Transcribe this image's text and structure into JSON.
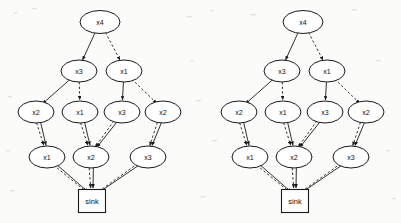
{
  "page": {
    "background_color": "#fbfbfa",
    "ink_color": "#1a1a1a",
    "width": 401,
    "height": 223
  },
  "diagrams": [
    {
      "id": "left-diagram",
      "name": "left-bdd",
      "origin_x": 0,
      "sink": {
        "label": "sink",
        "x": 92,
        "y": 201,
        "w": 27,
        "h": 23
      },
      "levels": [
        {
          "level": 1,
          "nodes": [
            {
              "id": "L1a",
              "label": "x4",
              "x": 100,
              "y": 22,
              "rx": 20,
              "ry": 11.5
            }
          ]
        },
        {
          "level": 2,
          "nodes": [
            {
              "id": "L2a",
              "label": "x3",
              "x": 79,
              "y": 71,
              "rx": 18,
              "ry": 11
            },
            {
              "id": "L2b",
              "label": "x1",
              "x": 124,
              "y": 71,
              "rx": 18,
              "ry": 11
            }
          ]
        },
        {
          "level": 3,
          "nodes": [
            {
              "id": "L3a",
              "label": "x2",
              "x": 36,
              "y": 112,
              "rx": 18,
              "ry": 11
            },
            {
              "id": "L3b",
              "label": "x1",
              "x": 80,
              "y": 112,
              "rx": 18,
              "ry": 11
            },
            {
              "id": "L3c",
              "label": "x3",
              "x": 122,
              "y": 112,
              "rx": 18,
              "ry": 11
            },
            {
              "id": "L3d",
              "label": "x2",
              "x": 163,
              "y": 112,
              "rx": 18,
              "ry": 11
            }
          ]
        },
        {
          "level": 4,
          "nodes": [
            {
              "id": "L4a",
              "label": "x1",
              "x": 47,
              "y": 157,
              "rx": 18,
              "ry": 11
            },
            {
              "id": "L4b",
              "label": "x2",
              "x": 91,
              "y": 157,
              "rx": 18,
              "ry": 11
            },
            {
              "id": "L4c",
              "label": "x3",
              "x": 148,
              "y": 157,
              "rx": 18,
              "ry": 11
            }
          ]
        }
      ],
      "edges": [
        {
          "from": "L1a",
          "to": "L2a",
          "style": "solid",
          "arrow": true
        },
        {
          "from": "L1a",
          "to": "L2b",
          "style": "dashed",
          "arrow": true
        },
        {
          "from": "L2a",
          "to": "L3a",
          "style": "solid",
          "arrow": true
        },
        {
          "from": "L2a",
          "to": "L3b",
          "style": "dashed",
          "arrow": true
        },
        {
          "from": "L2b",
          "to": "L3c",
          "style": "solid",
          "arrow": true
        },
        {
          "from": "L2b",
          "to": "L3d",
          "style": "dashed",
          "arrow": true
        },
        {
          "from": "L3a",
          "to": "L4a",
          "style": "solid",
          "arrow": true
        },
        {
          "from": "L3a",
          "to": "L4a",
          "style": "dashed",
          "arrow": true
        },
        {
          "from": "L3b",
          "to": "L4b",
          "style": "solid",
          "arrow": true
        },
        {
          "from": "L3b",
          "to": "L4b",
          "style": "dashed",
          "arrow": true
        },
        {
          "from": "L3c",
          "to": "L4b",
          "style": "solid",
          "arrow": true
        },
        {
          "from": "L3c",
          "to": "L4b",
          "style": "dashed",
          "arrow": true
        },
        {
          "from": "L3d",
          "to": "L4c",
          "style": "solid",
          "arrow": true
        },
        {
          "from": "L3d",
          "to": "L4c",
          "style": "dashed",
          "arrow": true
        },
        {
          "from": "L4a",
          "to": "sink",
          "style": "solid",
          "arrow": true
        },
        {
          "from": "L4a",
          "to": "sink",
          "style": "dashed",
          "arrow": true
        },
        {
          "from": "L4b",
          "to": "sink",
          "style": "solid",
          "arrow": true
        },
        {
          "from": "L4b",
          "to": "sink",
          "style": "dashed",
          "arrow": true
        },
        {
          "from": "L4c",
          "to": "sink",
          "style": "solid",
          "arrow": true
        },
        {
          "from": "L4c",
          "to": "sink",
          "style": "dashed",
          "arrow": true
        }
      ]
    },
    {
      "id": "right-diagram",
      "name": "right-bdd",
      "origin_x": 203,
      "sink": {
        "label": "sink",
        "x": 295,
        "y": 201,
        "w": 27,
        "h": 23
      },
      "levels": [
        {
          "level": 1,
          "nodes": [
            {
              "id": "R1a",
              "label": "x4",
              "x": 303,
              "y": 22,
              "rx": 20,
              "ry": 11.5
            }
          ]
        },
        {
          "level": 2,
          "nodes": [
            {
              "id": "R2a",
              "label": "x3",
              "x": 282,
              "y": 71,
              "rx": 18,
              "ry": 11
            },
            {
              "id": "R2b",
              "label": "x1",
              "x": 327,
              "y": 71,
              "rx": 18,
              "ry": 11
            }
          ]
        },
        {
          "level": 3,
          "nodes": [
            {
              "id": "R3a",
              "label": "x2",
              "x": 239,
              "y": 112,
              "rx": 18,
              "ry": 11
            },
            {
              "id": "R3b",
              "label": "x1",
              "x": 283,
              "y": 112,
              "rx": 18,
              "ry": 11
            },
            {
              "id": "R3c",
              "label": "x3",
              "x": 325,
              "y": 112,
              "rx": 18,
              "ry": 11
            },
            {
              "id": "R3d",
              "label": "x2",
              "x": 366,
              "y": 112,
              "rx": 18,
              "ry": 11
            }
          ]
        },
        {
          "level": 4,
          "nodes": [
            {
              "id": "R4a",
              "label": "x1",
              "x": 250,
              "y": 157,
              "rx": 18,
              "ry": 11
            },
            {
              "id": "R4b",
              "label": "x2",
              "x": 294,
              "y": 157,
              "rx": 18,
              "ry": 11
            },
            {
              "id": "R4c",
              "label": "x3",
              "x": 351,
              "y": 157,
              "rx": 18,
              "ry": 11
            }
          ]
        }
      ],
      "edges": [
        {
          "from": "R1a",
          "to": "R2a",
          "style": "solid",
          "arrow": true
        },
        {
          "from": "R1a",
          "to": "R2b",
          "style": "dashed",
          "arrow": true
        },
        {
          "from": "R2a",
          "to": "R3a",
          "style": "solid",
          "arrow": true
        },
        {
          "from": "R2a",
          "to": "R3b",
          "style": "dashed",
          "arrow": true
        },
        {
          "from": "R2b",
          "to": "R3c",
          "style": "solid",
          "arrow": true
        },
        {
          "from": "R2b",
          "to": "R3d",
          "style": "dashed",
          "arrow": true
        },
        {
          "from": "R3a",
          "to": "R4a",
          "style": "solid",
          "arrow": true
        },
        {
          "from": "R3a",
          "to": "R4a",
          "style": "dashed",
          "arrow": true
        },
        {
          "from": "R3b",
          "to": "R4b",
          "style": "solid",
          "arrow": true
        },
        {
          "from": "R3b",
          "to": "R4b",
          "style": "dashed",
          "arrow": true
        },
        {
          "from": "R3c",
          "to": "R4b",
          "style": "solid",
          "arrow": true
        },
        {
          "from": "R3c",
          "to": "R4b",
          "style": "dashed",
          "arrow": true
        },
        {
          "from": "R3d",
          "to": "R4c",
          "style": "solid",
          "arrow": true
        },
        {
          "from": "R3d",
          "to": "R4c",
          "style": "dashed",
          "arrow": true
        },
        {
          "from": "R4a",
          "to": "sink",
          "style": "solid",
          "arrow": true
        },
        {
          "from": "R4a",
          "to": "sink",
          "style": "dashed",
          "arrow": true
        },
        {
          "from": "R4b",
          "to": "sink",
          "style": "solid",
          "arrow": true
        },
        {
          "from": "R4b",
          "to": "sink",
          "style": "dashed",
          "arrow": true
        },
        {
          "from": "R4c",
          "to": "sink",
          "style": "solid",
          "arrow": true
        },
        {
          "from": "R4c",
          "to": "sink",
          "style": "dashed",
          "arrow": true
        }
      ]
    }
  ]
}
